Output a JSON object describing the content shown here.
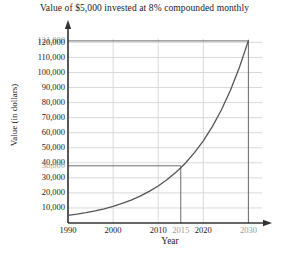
{
  "chart_data": {
    "type": "line",
    "title": "Value of $5,000 invested at 8% compounded monthly",
    "xlabel": "Year",
    "ylabel": "Value (in dollars)",
    "xlim": [
      1988,
      2033
    ],
    "ylim": [
      0,
      124000
    ],
    "grid": true,
    "legend": "none",
    "x_ticks": [
      {
        "value": 1990,
        "label": "1990",
        "muted": false
      },
      {
        "value": 2000,
        "label": "2000",
        "muted": false
      },
      {
        "value": 2010,
        "label": "2010",
        "muted": false
      },
      {
        "value": 2015,
        "label": "2015",
        "muted": true
      },
      {
        "value": 2020,
        "label": "2020",
        "muted": false
      },
      {
        "value": 2030,
        "label": "2030",
        "muted": true
      }
    ],
    "y_ticks": [
      {
        "value": 121000,
        "label": "121,000",
        "muted": true
      },
      {
        "value": 120000,
        "label": "120,000",
        "muted": false
      },
      {
        "value": 110000,
        "label": "110,000",
        "muted": false
      },
      {
        "value": 100000,
        "label": "100,000",
        "muted": false
      },
      {
        "value": 90000,
        "label": "90,000",
        "muted": false
      },
      {
        "value": 80000,
        "label": "80,000",
        "muted": false
      },
      {
        "value": 70000,
        "label": "70,000",
        "muted": false
      },
      {
        "value": 60000,
        "label": "60,000",
        "muted": false
      },
      {
        "value": 50000,
        "label": "50,000",
        "muted": false
      },
      {
        "value": 40000,
        "label": "40,000",
        "muted": false
      },
      {
        "value": 38000,
        "label": "38,000",
        "muted": true
      },
      {
        "value": 30000,
        "label": "30,000",
        "muted": false
      },
      {
        "value": 20000,
        "label": "20,000",
        "muted": false
      },
      {
        "value": 10000,
        "label": "10,000",
        "muted": false
      }
    ],
    "gridlines_x": [
      1990,
      2000,
      2010,
      2020,
      2030
    ],
    "gridlines_y": [
      10000,
      20000,
      30000,
      40000,
      50000,
      60000,
      70000,
      80000,
      90000,
      100000,
      110000,
      120000
    ],
    "series": [
      {
        "name": "Value of $5,000 at 8% compounded monthly",
        "x": [
          1990,
          1992,
          1994,
          1996,
          1998,
          2000,
          2002,
          2004,
          2006,
          2008,
          2010,
          2012,
          2014,
          2015,
          2016,
          2018,
          2020,
          2022,
          2024,
          2026,
          2028,
          2030
        ],
        "y": [
          5000,
          5864,
          6877,
          8065,
          9459,
          11093,
          13010,
          15258,
          17895,
          20988,
          24615,
          28869,
          33859,
          36711,
          39709,
          46568,
          54614,
          64049,
          75117,
          88099,
          103325,
          121182
        ]
      }
    ],
    "annotations": [
      {
        "type": "guideline",
        "orientation": "horizontal",
        "value": 38000,
        "from_x": 1990,
        "to_x": 2015
      },
      {
        "type": "guideline",
        "orientation": "vertical",
        "value": 2015,
        "from_y": 0,
        "to_y": 38000
      },
      {
        "type": "guideline",
        "orientation": "horizontal",
        "value": 121000,
        "from_x": 1990,
        "to_x": 2030
      },
      {
        "type": "guideline",
        "orientation": "vertical",
        "value": 2030,
        "from_y": 0,
        "to_y": 121000
      }
    ],
    "colors": {
      "curve": "#555555",
      "grid": "#d9d9d9",
      "axis": "#333333",
      "guideline": "#6b6b6b",
      "muted_label": "#9a9a9a",
      "text": "#1a1a1a"
    }
  }
}
